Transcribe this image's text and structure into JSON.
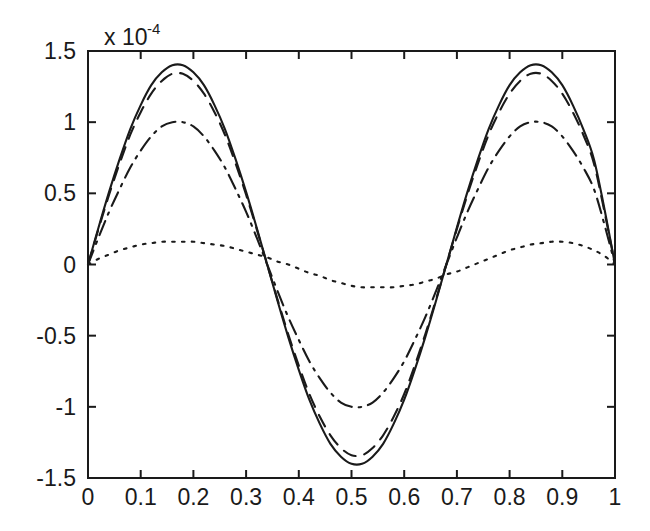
{
  "chart_data": {
    "type": "line",
    "title": "",
    "xlabel": "",
    "ylabel": "",
    "y_exponent_label": "x 10",
    "y_exponent_power": "-4",
    "y_scale_factor": 0.0001,
    "xlim": [
      0,
      1
    ],
    "ylim": [
      -1.5,
      1.5
    ],
    "grid": false,
    "legend": "none",
    "xticks": [
      "0",
      "0.1",
      "0.2",
      "0.3",
      "0.4",
      "0.5",
      "0.6",
      "0.7",
      "0.8",
      "0.9",
      "1"
    ],
    "xtick_values": [
      0,
      0.1,
      0.2,
      0.3,
      0.4,
      0.5,
      0.6,
      0.7,
      0.8,
      0.9,
      1
    ],
    "yticks": [
      "1.5",
      "1",
      "0.5",
      "0",
      "-0.5",
      "-1",
      "-1.5"
    ],
    "ytick_values": [
      1.5,
      1,
      0.5,
      0,
      -0.5,
      -1,
      -1.5
    ],
    "x": [
      0,
      0.02,
      0.04,
      0.06,
      0.08,
      0.1,
      0.12,
      0.14,
      0.16,
      0.18,
      0.2,
      0.22,
      0.24,
      0.26,
      0.28,
      0.3,
      0.32,
      0.34,
      0.36,
      0.38,
      0.4,
      0.42,
      0.44,
      0.46,
      0.48,
      0.5,
      0.52,
      0.54,
      0.56,
      0.58,
      0.6,
      0.62,
      0.64,
      0.66,
      0.68,
      0.7,
      0.72,
      0.74,
      0.76,
      0.78,
      0.8,
      0.82,
      0.84,
      0.86,
      0.88,
      0.9,
      0.92,
      0.94,
      0.96,
      0.98,
      1
    ],
    "series": [
      {
        "name": "curve-1",
        "style": "solid",
        "amplitude": 1.4,
        "values": [
          0,
          0.26,
          0.51,
          0.74,
          0.95,
          1.12,
          1.26,
          1.35,
          1.4,
          1.4,
          1.35,
          1.26,
          1.12,
          0.95,
          0.74,
          0.51,
          0.26,
          0,
          -0.26,
          -0.51,
          -0.74,
          -0.95,
          -1.12,
          -1.26,
          -1.35,
          -1.4,
          -1.4,
          -1.35,
          -1.26,
          -1.12,
          -0.95,
          -0.74,
          -0.51,
          -0.26,
          0,
          0.26,
          0.51,
          0.74,
          0.95,
          1.12,
          1.26,
          1.35,
          1.4,
          1.4,
          1.35,
          1.26,
          1.12,
          0.95,
          0.74,
          0.39,
          0
        ]
      },
      {
        "name": "curve-2",
        "style": "dashed",
        "amplitude": 1.34,
        "values": [
          0,
          0.25,
          0.49,
          0.71,
          0.91,
          1.07,
          1.2,
          1.29,
          1.34,
          1.34,
          1.29,
          1.2,
          1.07,
          0.91,
          0.71,
          0.49,
          0.25,
          0,
          -0.25,
          -0.49,
          -0.71,
          -0.91,
          -1.07,
          -1.2,
          -1.29,
          -1.34,
          -1.34,
          -1.29,
          -1.2,
          -1.07,
          -0.91,
          -0.71,
          -0.49,
          -0.25,
          0,
          0.25,
          0.49,
          0.71,
          0.91,
          1.07,
          1.2,
          1.29,
          1.34,
          1.34,
          1.29,
          1.2,
          1.07,
          0.91,
          0.71,
          0.37,
          0
        ]
      },
      {
        "name": "curve-3",
        "style": "dashdot",
        "amplitude": 1.0,
        "values": [
          0,
          0.19,
          0.37,
          0.53,
          0.68,
          0.8,
          0.9,
          0.97,
          1.0,
          1.0,
          0.97,
          0.9,
          0.8,
          0.68,
          0.53,
          0.37,
          0.19,
          0,
          -0.19,
          -0.37,
          -0.53,
          -0.68,
          -0.8,
          -0.9,
          -0.97,
          -1.0,
          -1.0,
          -0.97,
          -0.9,
          -0.8,
          -0.68,
          -0.53,
          -0.37,
          -0.19,
          0,
          0.19,
          0.37,
          0.53,
          0.68,
          0.8,
          0.9,
          0.97,
          1.0,
          1.0,
          0.97,
          0.9,
          0.8,
          0.68,
          0.53,
          0.28,
          0
        ]
      },
      {
        "name": "curve-4",
        "style": "dotted",
        "amplitude": 0.16,
        "values": [
          0,
          0.04,
          0.07,
          0.1,
          0.12,
          0.14,
          0.15,
          0.16,
          0.16,
          0.16,
          0.16,
          0.15,
          0.14,
          0.13,
          0.11,
          0.09,
          0.07,
          0.05,
          0.02,
          0,
          -0.03,
          -0.06,
          -0.08,
          -0.11,
          -0.13,
          -0.15,
          -0.16,
          -0.16,
          -0.16,
          -0.16,
          -0.15,
          -0.14,
          -0.12,
          -0.1,
          -0.07,
          -0.05,
          -0.02,
          0.01,
          0.04,
          0.07,
          0.1,
          0.12,
          0.14,
          0.15,
          0.16,
          0.16,
          0.15,
          0.13,
          0.1,
          0.06,
          0
        ]
      }
    ]
  }
}
